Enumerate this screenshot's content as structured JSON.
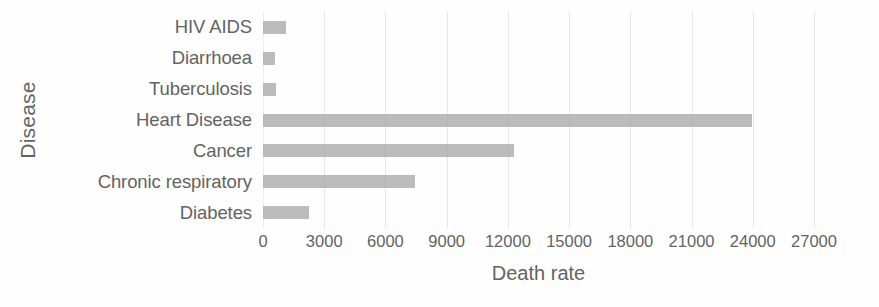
{
  "chart_data": {
    "type": "bar",
    "orientation": "horizontal",
    "title": "",
    "xlabel": "Death rate",
    "ylabel": "Disease",
    "categories": [
      "HIV AIDS",
      "Diarrhoea",
      "Tuberculosis",
      "Heart Disease",
      "Cancer",
      "Chronic respiratory",
      "Diabetes"
    ],
    "values": [
      1130,
      590,
      650,
      23950,
      12300,
      7450,
      2270
    ],
    "xlim": [
      0,
      27000
    ],
    "xticks": [
      0,
      3000,
      6000,
      9000,
      12000,
      15000,
      18000,
      21000,
      24000,
      27000
    ],
    "xtick_labels": [
      "0",
      "3000",
      "6000",
      "9000",
      "12000",
      "15000",
      "18000",
      "21000",
      "24000",
      "27000"
    ],
    "grid": "vertical",
    "legend": "none",
    "bar_color": "#a8a8a8",
    "grid_color": "#e6e6e6",
    "text_color": "#636363"
  }
}
